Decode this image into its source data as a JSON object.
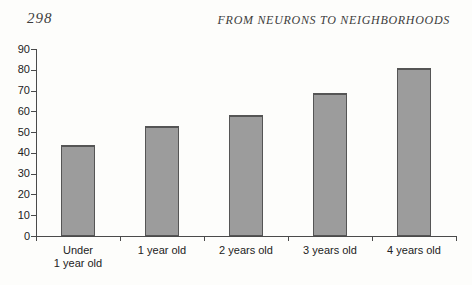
{
  "page": {
    "page_number": "298",
    "running_header": "FROM NEURONS TO NEIGHBORHOODS"
  },
  "chart_data": {
    "type": "bar",
    "categories": [
      "Under 1 year old",
      "1 year old",
      "2 years old",
      "3 years old",
      "4 years old"
    ],
    "category_label_lines": [
      [
        "Under",
        "1 year old"
      ],
      [
        "1 year old"
      ],
      [
        "2 years old"
      ],
      [
        "3 years old"
      ],
      [
        "4 years old"
      ]
    ],
    "values": [
      44,
      53,
      58,
      69,
      81
    ],
    "title": "",
    "xlabel": "",
    "ylabel": "",
    "ylim": [
      0,
      90
    ],
    "yticks": [
      0,
      10,
      20,
      30,
      40,
      50,
      60,
      70,
      80,
      90
    ],
    "grid": false,
    "legend_position": "none",
    "bar_fill": "#9c9c9c",
    "bar_border": "#555555",
    "axis_color": "#4a4a4a",
    "label_color": "#222222"
  }
}
